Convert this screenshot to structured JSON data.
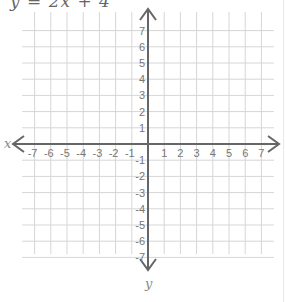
{
  "equation": "y = 2x + 4",
  "graph": {
    "x_axis_label": "x",
    "y_axis_label": "y",
    "x_range": [
      -7,
      7
    ],
    "y_range": [
      -7,
      7
    ],
    "x_ticks": [
      "-7",
      "-6",
      "-5",
      "-4",
      "-3",
      "-2",
      "-1",
      "1",
      "2",
      "3",
      "4",
      "5",
      "6",
      "7"
    ],
    "y_ticks": [
      "7",
      "6",
      "5",
      "4",
      "3",
      "2",
      "1",
      "-1",
      "-2",
      "-3",
      "-4",
      "-5",
      "-6",
      "-7"
    ],
    "grid_color": "#d6d6d6",
    "axis_color": "#666666",
    "label_color": "#777777"
  }
}
